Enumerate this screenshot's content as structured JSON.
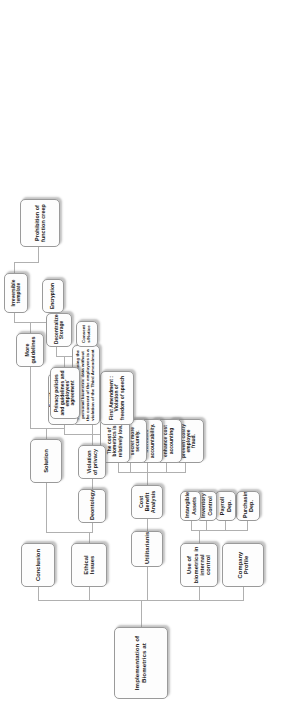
{
  "diagram": {
    "title": "Implementation of Biometrics at",
    "type": "tree",
    "orientation": "rotated-90-counterclockwise",
    "background_color": "#ffffff",
    "node_fill": "#fdfdfd",
    "node_border": "#9a9a9a",
    "connector_color": "#b0b0b0"
  },
  "root": {
    "label": "Implementation of Biometrics at"
  },
  "level1": {
    "company_profile": "Company Profile",
    "use_of_biometrics": "Use of biometrics in internal control",
    "utilitarianism": "Utilitarianism",
    "ethical_issues": "Ethical Issues",
    "conclusion": "Conclusion"
  },
  "internal_control_children": [
    {
      "label": "Purchasing Dep."
    },
    {
      "label": "Payroll Dep."
    },
    {
      "label": "Inventory Control"
    },
    {
      "label": "Intangible Assets"
    }
  ],
  "utilitarianism_children": {
    "cost_benefit": "Cost Benefit Analysis",
    "leaves": [
      {
        "label": "Biometrics can prevent costly employee fraud."
      },
      {
        "label": "Biometrics can enhance cost accounting"
      },
      {
        "label": "Biometrics increases accountability."
      },
      {
        "label": "Biometrics protects trade secret more securely."
      },
      {
        "label": "The cost of biometrics is relatively low."
      }
    ]
  },
  "ethical_issues_children": {
    "deontology": "Deontology",
    "violation_of_privacy": "Violation of privacy",
    "amendments": [
      {
        "label": "First Amendment : Violation of freedom of speech"
      },
      {
        "label": "Third Amendment : obtaining the personal biometric data without the consent of the employees is a violation of the Third Amendment"
      },
      {
        "label": "Fourth Amendment: violation of freedom to feel secure"
      }
    ]
  },
  "solution_branch": {
    "solution": "Solution",
    "privacy_policies": "Privacy policies and guidelines and employees' agreement",
    "more_guidelines": "More guidelines",
    "policy_children": [
      {
        "label": "Consent s/Notice"
      },
      {
        "label": "Decentralized Storage"
      }
    ],
    "guideline_children": [
      {
        "label": "Encryption"
      },
      {
        "label": "Irreversible template"
      }
    ],
    "function_creep": "Prohibition of function creep"
  }
}
